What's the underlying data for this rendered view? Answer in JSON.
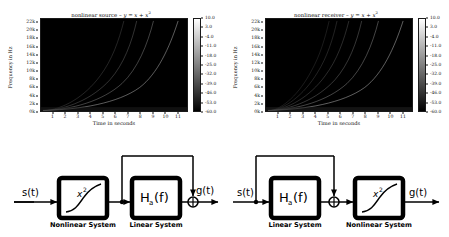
{
  "figure": {
    "panels": [
      {
        "id": "nonlinear-source",
        "title_prefix": "nonlinear source – ",
        "title_eq_lhs": "y",
        "title_eq_rhs": " = x + x",
        "title_eq_exp": "2",
        "title_full": "nonlinear source – y = x + x²",
        "xlabel": "Time in seconds",
        "ylabel": "Frequency in Hz",
        "xticks": [
          "1",
          "2",
          "3",
          "4",
          "5",
          "6",
          "7",
          "8",
          "9",
          "10",
          "11"
        ],
        "yticks": [
          "22k",
          "20k",
          "18k",
          "16k",
          "14k",
          "12k",
          "10k",
          "8k",
          "6k",
          "4k",
          "2k",
          "0k"
        ],
        "cbar_ticks": [
          "10.0",
          "3.0",
          "-4.0",
          "-11.0",
          "-18.0",
          "-25.0",
          "-32.0",
          "-39.0",
          "-46.0",
          "-53.0",
          "-60.0"
        ]
      },
      {
        "id": "nonlinear-receiver",
        "title_prefix": "nonlinear receiver – ",
        "title_eq_lhs": "y",
        "title_eq_rhs": " = x + x",
        "title_eq_exp": "2",
        "title_full": "nonlinear receiver – y = x + x²",
        "xlabel": "Time in seconds",
        "ylabel": "Frequency in Hz",
        "xticks": [
          "1",
          "2",
          "3",
          "4",
          "5",
          "6",
          "7",
          "8",
          "9",
          "10",
          "11"
        ],
        "yticks": [
          "22k",
          "20k",
          "18k",
          "16k",
          "14k",
          "12k",
          "10k",
          "8k",
          "6k",
          "4k",
          "2k",
          "0k"
        ],
        "cbar_ticks": [
          "10.0",
          "3.0",
          "-4.0",
          "-11.0",
          "-18.0",
          "-25.0",
          "-32.0",
          "-39.0",
          "-46.0",
          "-53.0",
          "-60.0"
        ]
      }
    ]
  },
  "chart_data": [
    {
      "type": "heatmap",
      "title": "nonlinear source – y = x + x²",
      "xlabel": "Time in seconds",
      "ylabel": "Frequency in Hz",
      "xlim": [
        0,
        11.8
      ],
      "ylim": [
        0,
        23000
      ],
      "xticks": [
        1,
        2,
        3,
        4,
        5,
        6,
        7,
        8,
        9,
        10,
        11
      ],
      "xticklabels": [
        "1",
        "2",
        "3",
        "4",
        "5",
        "6",
        "7",
        "8",
        "9",
        "10",
        "11"
      ],
      "yticks": [
        0,
        2000,
        4000,
        6000,
        8000,
        10000,
        12000,
        14000,
        16000,
        18000,
        20000,
        22000
      ],
      "yticklabels": [
        "0k",
        "2k",
        "4k",
        "6k",
        "8k",
        "10k",
        "12k",
        "14k",
        "16k",
        "18k",
        "20k",
        "22k"
      ],
      "grid": false,
      "colormap": "gray",
      "colorbar": {
        "label": "",
        "ticks": [
          10.0,
          3.0,
          -4.0,
          -11.0,
          -18.0,
          -25.0,
          -32.0,
          -39.0,
          -46.0,
          -53.0,
          -60.0
        ],
        "ticklabels": [
          "10.0",
          "3.0",
          "-4.0",
          "-11.0",
          "-18.0",
          "-25.0",
          "-32.0",
          "-39.0",
          "-46.0",
          "-53.0",
          "-60.0"
        ],
        "vmin": -60.0,
        "vmax": 10.0,
        "units": "dB",
        "position": "right"
      },
      "description": "Spectrogram of an exponential sine sweep through a squaring nonlinearity; fundamental plus harmonic sweep traces curve upward exponentially in frequency.",
      "traces": [
        {
          "name": "harmonic-1 (fundamental)",
          "harmonic": 1,
          "time_reaches_22k": 11.8
        },
        {
          "name": "harmonic-2",
          "harmonic": 2,
          "time_reaches_22k": 9.7
        },
        {
          "name": "harmonic-3",
          "harmonic": 3,
          "time_reaches_22k": 8.6
        },
        {
          "name": "harmonic-4",
          "harmonic": 4,
          "time_reaches_22k": 7.8
        }
      ]
    },
    {
      "type": "heatmap",
      "title": "nonlinear receiver – y = x + x²",
      "xlabel": "Time in seconds",
      "ylabel": "Frequency in Hz",
      "xlim": [
        0,
        11.8
      ],
      "ylim": [
        0,
        23000
      ],
      "xticks": [
        1,
        2,
        3,
        4,
        5,
        6,
        7,
        8,
        9,
        10,
        11
      ],
      "xticklabels": [
        "1",
        "2",
        "3",
        "4",
        "5",
        "6",
        "7",
        "8",
        "9",
        "10",
        "11"
      ],
      "yticks": [
        0,
        2000,
        4000,
        6000,
        8000,
        10000,
        12000,
        14000,
        16000,
        18000,
        20000,
        22000
      ],
      "yticklabels": [
        "0k",
        "2k",
        "4k",
        "6k",
        "8k",
        "10k",
        "12k",
        "14k",
        "16k",
        "18k",
        "20k",
        "22k"
      ],
      "grid": false,
      "colormap": "gray",
      "colorbar": {
        "label": "",
        "ticks": [
          10.0,
          3.0,
          -4.0,
          -11.0,
          -18.0,
          -25.0,
          -32.0,
          -39.0,
          -46.0,
          -53.0,
          -60.0
        ],
        "ticklabels": [
          "10.0",
          "3.0",
          "-4.0",
          "-11.0",
          "-18.0",
          "-25.0",
          "-32.0",
          "-39.0",
          "-46.0",
          "-53.0",
          "-60.0"
        ],
        "vmin": -60.0,
        "vmax": 10.0,
        "units": "dB",
        "position": "right"
      },
      "description": "Spectrogram for the nonlinear receiver configuration; additional harmonic sweep traces with higher density are visible compared with the source case.",
      "traces": [
        {
          "name": "harmonic-1 (fundamental)",
          "harmonic": 1,
          "time_reaches_22k": 11.8
        },
        {
          "name": "harmonic-2",
          "harmonic": 2,
          "time_reaches_22k": 9.7
        },
        {
          "name": "harmonic-3",
          "harmonic": 3,
          "time_reaches_22k": 8.6
        },
        {
          "name": "harmonic-4",
          "harmonic": 4,
          "time_reaches_22k": 7.8
        },
        {
          "name": "harmonic-5",
          "harmonic": 5,
          "time_reaches_22k": 7.2
        },
        {
          "name": "harmonic-6",
          "harmonic": 6,
          "time_reaches_22k": 6.8
        }
      ]
    }
  ],
  "diagrams": [
    {
      "id": "nonlinear-source-chain",
      "input_label": "s(t)",
      "output_label": "g(t)",
      "blocks": [
        {
          "id": "nonlinear",
          "symbol": "x",
          "exponent": "2",
          "caption": "Nonlinear System"
        },
        {
          "id": "linear",
          "symbol": "H",
          "subscript": "a",
          "arg": "(f)",
          "caption": "Linear System"
        }
      ],
      "sum_symbol": "+",
      "order": [
        "nonlinear",
        "linear"
      ]
    },
    {
      "id": "nonlinear-receiver-chain",
      "input_label": "s(t)",
      "output_label": "g(t)",
      "blocks": [
        {
          "id": "linear",
          "symbol": "H",
          "subscript": "a",
          "arg": "(f)",
          "caption": "Linear  System"
        },
        {
          "id": "nonlinear",
          "symbol": "x",
          "exponent": "2",
          "caption": "Nonlinear System"
        }
      ],
      "sum_symbol": "+",
      "order": [
        "linear",
        "nonlinear"
      ]
    }
  ],
  "colors": {
    "background": "#ffffff",
    "ink": "#000000",
    "plot_background": "#000000",
    "trace": "#d8d8d8"
  }
}
